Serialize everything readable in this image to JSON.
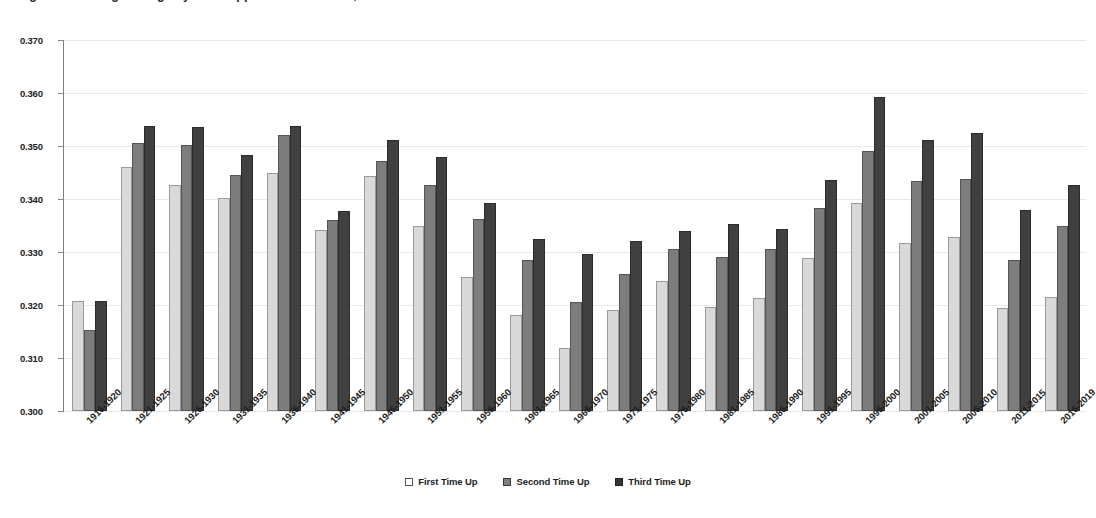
{
  "chart_data": {
    "type": "bar",
    "title": "Figure 4: Batting Average by Plate Appearance in Game, Five-Year Periods",
    "subtitle": "",
    "xlabel": "",
    "ylabel": "",
    "ylim": [
      0.3,
      0.37
    ],
    "ytick_step": 0.01,
    "ytick_labels": [
      "0.370",
      "0.360",
      "0.350",
      "0.340",
      "0.330",
      "0.320",
      "0.310",
      "0.300"
    ],
    "ytick_values": [
      0.37,
      0.36,
      0.35,
      0.34,
      0.33,
      0.32,
      0.31,
      0.3
    ],
    "grid": true,
    "legend_position": "bottom",
    "categories": [
      "1916-1920",
      "1921-1925",
      "1926-1930",
      "1931-1935",
      "1936-1940",
      "1941-1945",
      "1946-1950",
      "1951-1955",
      "1956-1960",
      "1961-1965",
      "1966-1970",
      "1971-1975",
      "1976-1980",
      "1981-1985",
      "1986-1990",
      "1991-1995",
      "1996-2000",
      "2001-2005",
      "2006-2010",
      "2011-2015",
      "2016-2019"
    ],
    "series": [
      {
        "name": "First Time Up",
        "color": "#d9d9d9",
        "values": [
          0.3207,
          0.3461,
          0.3427,
          0.3402,
          0.345,
          0.3341,
          0.3444,
          0.335,
          0.3252,
          0.3181,
          0.3118,
          0.319,
          0.3245,
          0.3197,
          0.3214,
          0.3289,
          0.3393,
          0.3317,
          0.3328,
          0.3194,
          0.3215
        ]
      },
      {
        "name": "Second Time Up",
        "color": "#7d7d7d",
        "values": [
          0.3152,
          0.3505,
          0.3502,
          0.3446,
          0.3521,
          0.336,
          0.3472,
          0.3427,
          0.3363,
          0.3285,
          0.3205,
          0.3259,
          0.3305,
          0.3291,
          0.3305,
          0.3383,
          0.349,
          0.3434,
          0.3438,
          0.3285,
          0.335
        ]
      },
      {
        "name": "Third Time Up",
        "color": "#404040",
        "values": [
          0.3207,
          0.3537,
          0.3535,
          0.3483,
          0.3537,
          0.3377,
          0.3511,
          0.348,
          0.3392,
          0.3324,
          0.3297,
          0.3321,
          0.334,
          0.3352,
          0.3344,
          0.3436,
          0.3593,
          0.3511,
          0.3525,
          0.338,
          0.3426
        ]
      }
    ]
  },
  "legend": {
    "items": [
      {
        "label": "First Time Up"
      },
      {
        "label": "Second Time Up"
      },
      {
        "label": "Third Time Up"
      }
    ]
  }
}
